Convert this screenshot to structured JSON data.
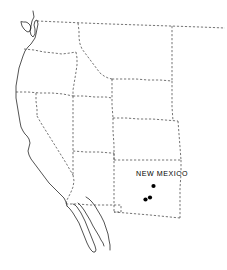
{
  "figure": {
    "type": "locality-map",
    "region": "Western United States",
    "background_color": "#ffffff",
    "width": 227,
    "height": 270
  },
  "labels": [
    {
      "name": "new-mexico-label",
      "text": "NEW MEXICO",
      "x": 162,
      "y": 176,
      "anchor": "middle"
    }
  ],
  "localities": {
    "symbol": "filled-circle",
    "color": "#000000",
    "count": 3,
    "radius": 2.1,
    "points": [
      {
        "id": "locality-1",
        "x": 153.5,
        "y": 186.0
      },
      {
        "id": "locality-2",
        "x": 145.5,
        "y": 199.5
      },
      {
        "id": "locality-3",
        "x": 150.0,
        "y": 197.5
      }
    ]
  },
  "styles": {
    "coastline_color": "#1a1a1a",
    "border_color": "#3a3a3a",
    "border_dash": "2.2 1.8",
    "coastline_width": 0.75,
    "border_width": 0.7
  },
  "geometry": {
    "coastlines": [
      {
        "id": "pacific-coast",
        "name": "pacific-coastline",
        "d": "M 33 11 L 34 17 L 32 21 L 31 26 L 30 31 L 31 35 L 33 37 L 35 34 L 35 29 L 34 25 L 35 21 L 37 20 L 38 24 L 37 29 L 36 34 L 35 38 L 33 41 L 31 44 L 28 47 L 25 51 L 23 56 L 21 62 L 19 68 L 18 74 L 17 80 L 16 86 L 16 92 L 16 98 L 17 104 L 18 110 L 19 116 L 20 122 L 21 127 L 23 131 L 25 134 L 27 136 L 29 139 L 30 143 L 29 147 L 28 151 L 29 155 L 31 159 L 34 163 L 37 167 L 40 171 L 43 175 L 46 179 L 49 183 L 52 186 L 55 189 L 58 192 L 61 195 L 64 198 L 66 202 L 67 206"
      },
      {
        "id": "puget-sound",
        "name": "puget-sound-inlet",
        "d": "M 21 22 L 22 26 L 24 29 L 26 31 L 28 32 L 30 31 L 31 28 L 30 25 L 28 23 L 26 22 L 24 22 Z"
      },
      {
        "id": "baja-peninsula",
        "name": "baja-california-peninsula",
        "d": "M 67 206 L 70 209 L 73 213 L 76 218 L 79 223 L 81 228 L 83 233 L 85 238 L 87 243 L 89 247 L 91 250 L 93 252 L 95 252 L 96 250 L 95 246 L 93 241 L 91 236 L 89 231 L 87 226 L 85 221 L 83 217 L 81 213 L 79 210 L 77 207 L 75 205 L 73 204"
      },
      {
        "id": "gulf-of-california-east",
        "name": "gulf-of-california-east-shore",
        "d": "M 78 203 L 81 206 L 84 210 L 87 215 L 90 220 L 93 226 L 96 231 L 99 236 L 101 240 L 103 243 L 104 246"
      },
      {
        "id": "mexico-west-coast",
        "name": "mexico-west-coastline",
        "d": "M 86 197 L 89 199 L 92 202 L 95 206 L 98 211 L 101 216 L 104 222 L 106 228 L 108 234 L 109 240 L 110 245 L 110 250"
      }
    ],
    "borders": [
      {
        "id": "canada-border",
        "name": "canada-us-border",
        "d": "M 37 21 L 60 22 L 84 23 L 110 24 L 140 25 L 170 26 L 200 27 L 225 28"
      },
      {
        "id": "wa-or-border",
        "name": "washington-oregon-border",
        "d": "M 24 49 L 34 50 L 44 52 L 54 53 L 62 54 L 70 53 L 76 52"
      },
      {
        "id": "id-west-border",
        "name": "idaho-western-border",
        "d": "M 76 52 L 77 58 L 77 65 L 76 72 L 75 78 L 74 84 L 73 90 L 73 96"
      },
      {
        "id": "or-ca-border",
        "name": "oregon-california-border",
        "d": "M 16 92 L 28 92 L 40 93 L 52 93 L 63 94 L 73 96"
      },
      {
        "id": "id-panhandle",
        "name": "idaho-panhandle-border",
        "d": "M 78 23 L 79 31 L 79 38 L 80 44 L 82 49 L 85 53 L 88 57 L 91 61 L 94 65 L 97 69 L 100 73 L 104 76 L 108 78 L 112 79"
      },
      {
        "id": "mt-wy-border",
        "name": "montana-wyoming-border",
        "d": "M 112 79 L 124 79 L 136 79 L 148 80 L 160 80 L 172 81"
      },
      {
        "id": "mt-nd-border",
        "name": "montana-dakota-border",
        "d": "M 172 26 L 172 40 L 172 54 L 172 68 L 172 81"
      },
      {
        "id": "wy-south-border",
        "name": "wyoming-southern-border",
        "d": "M 112 79 L 112 92 L 112 105 L 113 118"
      },
      {
        "id": "wy-co-border",
        "name": "wyoming-colorado-border",
        "d": "M 113 118 L 126 118 L 139 119 L 152 119 L 165 120 L 178 121"
      },
      {
        "id": "wy-ne-border",
        "name": "wyoming-nebraska-border",
        "d": "M 172 81 L 172 94 L 172 107 L 173 121"
      },
      {
        "id": "co-east-border",
        "name": "colorado-eastern-border",
        "d": "M 178 121 L 179 134 L 180 147 L 181 160"
      },
      {
        "id": "co-south-border",
        "name": "colorado-southern-border",
        "d": "M 114 160 L 128 160 L 142 160 L 156 160 L 167 160 L 181 160"
      },
      {
        "id": "ut-co-border",
        "name": "utah-colorado-border",
        "d": "M 113 118 L 113 131 L 114 145 L 114 160"
      },
      {
        "id": "ut-north-border",
        "name": "utah-northern-border",
        "d": "M 73 96 L 84 96 L 95 97 L 106 97 L 112 98"
      },
      {
        "id": "nv-ut-border",
        "name": "nevada-utah-border",
        "d": "M 73 96 L 73 110 L 73 124 L 73 138 L 73 151 L 73 164 L 73 175"
      },
      {
        "id": "az-ut-border",
        "name": "arizona-utah-border",
        "d": "M 73 151 L 86 152 L 99 152 L 111 153 L 114 153"
      },
      {
        "id": "nv-ca-border",
        "name": "nevada-california-border",
        "d": "M 37 116 L 41 123 L 46 131 L 51 139 L 56 147 L 61 155 L 66 163 L 70 170 L 73 175"
      },
      {
        "id": "ca-nv-north-seg",
        "name": "california-nevada-north-segment",
        "d": "M 36 93 L 36 101 L 37 109 L 37 116"
      },
      {
        "id": "ca-az-border",
        "name": "california-arizona-border",
        "d": "M 73 175 L 74 181 L 73 187 L 71 192 L 69 196 L 67 200 L 66 204"
      },
      {
        "id": "az-nm-border",
        "name": "arizona-new-mexico-border",
        "d": "M 114 153 L 114 166 L 114 179 L 114 192 L 114 204 L 114 212"
      },
      {
        "id": "mexico-border-az",
        "name": "mexico-border-arizona",
        "d": "M 66 204 L 78 204 L 90 205 L 100 205 L 107 205 L 114 205"
      },
      {
        "id": "nm-south-border",
        "name": "new-mexico-southern-border",
        "d": "M 114 212 L 126 213 L 138 214 L 150 215 L 160 216 L 170 217 L 180 218"
      },
      {
        "id": "nm-bootheel",
        "name": "new-mexico-bootheel",
        "d": "M 114 205 L 121 205 L 121 212 L 114 212"
      },
      {
        "id": "nm-east-border",
        "name": "new-mexico-eastern-border",
        "d": "M 181 160 L 181 174 L 180 188 L 180 202 L 180 218"
      }
    ]
  }
}
